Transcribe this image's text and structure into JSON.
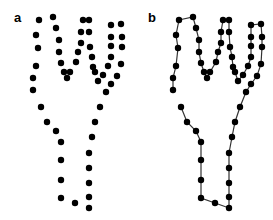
{
  "panels": [
    {
      "label": "a",
      "description": "unordered point set",
      "connected": false
    },
    {
      "label": "b",
      "description": "points connected into closed contour",
      "connected": true
    }
  ],
  "points_a": [
    [
      41,
      107
    ],
    [
      47,
      122
    ],
    [
      56,
      131
    ],
    [
      61,
      142
    ],
    [
      61,
      160
    ],
    [
      61,
      180
    ],
    [
      61,
      198
    ],
    [
      75,
      203
    ],
    [
      89,
      208
    ],
    [
      89,
      197
    ],
    [
      89,
      183
    ],
    [
      89,
      168
    ],
    [
      89,
      153
    ],
    [
      92,
      137
    ],
    [
      95,
      122
    ],
    [
      100,
      107
    ],
    [
      106,
      92
    ],
    [
      111,
      84
    ],
    [
      117,
      76
    ],
    [
      121,
      64
    ],
    [
      122,
      47
    ],
    [
      122,
      37
    ],
    [
      121,
      24
    ],
    [
      111,
      25
    ],
    [
      111,
      37
    ],
    [
      111,
      46
    ],
    [
      111,
      57
    ],
    [
      108,
      66
    ],
    [
      103,
      75
    ],
    [
      98,
      81
    ],
    [
      95,
      72
    ],
    [
      93,
      67
    ],
    [
      92,
      57
    ],
    [
      90,
      47
    ],
    [
      89,
      32
    ],
    [
      89,
      20
    ],
    [
      83,
      20
    ],
    [
      81,
      32
    ],
    [
      81,
      43
    ],
    [
      78,
      52
    ],
    [
      76,
      62
    ],
    [
      70,
      72
    ],
    [
      67,
      78
    ],
    [
      64,
      72
    ],
    [
      61,
      63
    ],
    [
      59,
      52
    ],
    [
      59,
      40
    ],
    [
      56,
      28
    ],
    [
      53,
      17
    ],
    [
      39,
      20
    ],
    [
      36,
      35
    ],
    [
      38,
      48
    ],
    [
      36,
      66
    ],
    [
      33,
      78
    ],
    [
      33,
      90
    ]
  ],
  "offset_b": 140,
  "colors": {
    "point": "#000000",
    "line": "#333333"
  }
}
